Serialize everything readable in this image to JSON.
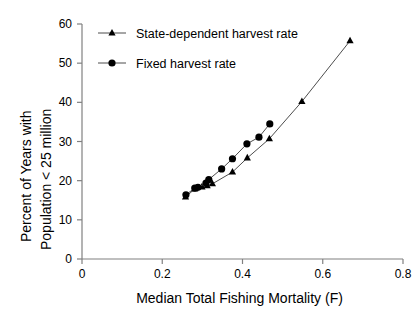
{
  "chart_data": {
    "type": "line",
    "title": "",
    "subtitle": "",
    "xlabel": "Median Total Fishing Mortality (F)",
    "ylabel": "Percent of Years with Population < 25 million",
    "ylabel_line1": "Percent of Years with",
    "ylabel_line2": "Population < 25 million",
    "xlim": [
      0,
      0.8
    ],
    "ylim": [
      0,
      60
    ],
    "xticks": [
      "0",
      "0.2",
      "0.4",
      "0.6",
      "0.8"
    ],
    "xtick_values": [
      0,
      0.2,
      0.4,
      0.6,
      0.8
    ],
    "yticks": [
      "0",
      "10",
      "20",
      "30",
      "40",
      "50",
      "60"
    ],
    "ytick_values": [
      0,
      10,
      20,
      30,
      40,
      50,
      60
    ],
    "grid": false,
    "legend_position": "upper-left-inside",
    "series": [
      {
        "name": "State-dependent harvest rate",
        "marker": "triangle",
        "color": "#000000",
        "points": [
          {
            "x": 0.258,
            "y": 15.8
          },
          {
            "x": 0.281,
            "y": 17.9
          },
          {
            "x": 0.299,
            "y": 18.4
          },
          {
            "x": 0.312,
            "y": 18.7
          },
          {
            "x": 0.325,
            "y": 19.2
          },
          {
            "x": 0.375,
            "y": 22.2
          },
          {
            "x": 0.412,
            "y": 25.8
          },
          {
            "x": 0.467,
            "y": 30.7
          },
          {
            "x": 0.548,
            "y": 40.2
          },
          {
            "x": 0.668,
            "y": 55.7
          }
        ]
      },
      {
        "name": "Fixed harvest rate",
        "marker": "circle",
        "color": "#000000",
        "points": [
          {
            "x": 0.259,
            "y": 16.4
          },
          {
            "x": 0.281,
            "y": 18.1
          },
          {
            "x": 0.289,
            "y": 18.3
          },
          {
            "x": 0.309,
            "y": 19.4
          },
          {
            "x": 0.316,
            "y": 20.3
          },
          {
            "x": 0.348,
            "y": 23.0
          },
          {
            "x": 0.375,
            "y": 25.6
          },
          {
            "x": 0.411,
            "y": 29.4
          },
          {
            "x": 0.441,
            "y": 31.1
          },
          {
            "x": 0.468,
            "y": 34.5
          }
        ]
      }
    ],
    "legend": [
      {
        "label": "State-dependent harvest rate",
        "marker": "triangle"
      },
      {
        "label": "Fixed harvest rate",
        "marker": "circle"
      }
    ]
  },
  "axes": {
    "x_title": "Median Total Fishing Mortality (F)",
    "y_title_line1": "Percent of Years with",
    "y_title_line2": "Population < 25 million",
    "x_tick_labels": [
      "0",
      "0.2",
      "0.4",
      "0.6",
      "0.8"
    ],
    "y_tick_labels": [
      "0",
      "10",
      "20",
      "30",
      "40",
      "50",
      "60"
    ]
  },
  "legend": {
    "entry_state_dependent": "State-dependent harvest rate",
    "entry_fixed": "Fixed harvest rate"
  },
  "colors": {
    "line": "#4d4d4d",
    "marker": "#000000",
    "axis": "#808080",
    "text": "#000000",
    "background": "#ffffff"
  }
}
